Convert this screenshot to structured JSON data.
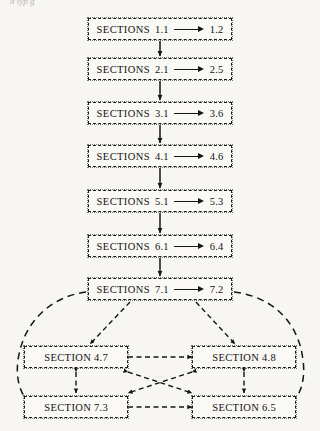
{
  "figure": {
    "caption_remnant": "a typ g",
    "background_color": "#f7f6f3",
    "ink_color": "#141414"
  },
  "sequence_nodes": [
    {
      "id": "sections-1",
      "keyword": "SECTIONS",
      "from": "1.1",
      "to": "1.2",
      "arrow": "right-arrow"
    },
    {
      "id": "sections-2",
      "keyword": "SECTIONS",
      "from": "2.1",
      "to": "2.5",
      "arrow": "right-arrow"
    },
    {
      "id": "sections-3",
      "keyword": "SECTIONS",
      "from": "3.1",
      "to": "3.6",
      "arrow": "right-arrow"
    },
    {
      "id": "sections-4",
      "keyword": "SECTIONS",
      "from": "4.1",
      "to": "4.6",
      "arrow": "right-arrow"
    },
    {
      "id": "sections-5",
      "keyword": "SECTIONS",
      "from": "5.1",
      "to": "5.3",
      "arrow": "right-arrow"
    },
    {
      "id": "sections-6",
      "keyword": "SECTIONS",
      "from": "6.1",
      "to": "6.4",
      "arrow": "right-arrow"
    },
    {
      "id": "sections-7",
      "keyword": "SECTIONS",
      "from": "7.1",
      "to": "7.2",
      "arrow": "right-arrow"
    }
  ],
  "grid_nodes": [
    {
      "id": "section-4-7",
      "keyword": "SECTION",
      "number": "4.7"
    },
    {
      "id": "section-4-8",
      "keyword": "SECTION",
      "number": "4.8"
    },
    {
      "id": "section-7-3",
      "keyword": "SECTION",
      "number": "7.3"
    },
    {
      "id": "section-6-5",
      "keyword": "SECTION",
      "number": "6.5"
    }
  ],
  "connectors": {
    "vertical_chain": [
      "sections-1 -> sections-2",
      "sections-2 -> sections-3",
      "sections-3 -> sections-4",
      "sections-4 -> sections-5",
      "sections-5 -> sections-6",
      "sections-6 -> sections-7"
    ],
    "branch": [
      "sections-7 -> section-4-7",
      "sections-7 -> section-4-8"
    ],
    "bidirectional": [
      "section-4-7 <-> section-4-8",
      "section-7-3 <-> section-6-5",
      "section-4-7 <-> section-7-3",
      "section-4-8 <-> section-6-5",
      "section-4-7 <-> section-6-5",
      "section-4-8 <-> section-7-3"
    ],
    "enclosing_loop": "dashed oval around grid nodes returning to sections-7"
  }
}
